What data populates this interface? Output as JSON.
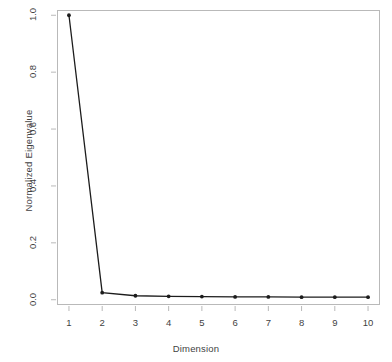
{
  "chart_data": {
    "type": "line",
    "title": "",
    "xlabel": "Dimension",
    "ylabel": "Normalized Eigenvalue",
    "x": [
      1,
      2,
      3,
      4,
      5,
      6,
      7,
      8,
      9,
      10
    ],
    "values": [
      1.0,
      0.025,
      0.014,
      0.012,
      0.011,
      0.01,
      0.01,
      0.009,
      0.009,
      0.009
    ],
    "series": [
      {
        "name": "Normalized Eigenvalue",
        "values": [
          1.0,
          0.025,
          0.014,
          0.012,
          0.011,
          0.01,
          0.01,
          0.009,
          0.009,
          0.009
        ]
      }
    ],
    "xlim": [
      0.64,
      10.36
    ],
    "ylim": [
      -0.0185,
      1.0185
    ],
    "xticks": [
      1,
      2,
      3,
      4,
      5,
      6,
      7,
      8,
      9,
      10
    ],
    "xtick_labels": [
      "1",
      "2",
      "3",
      "4",
      "5",
      "6",
      "7",
      "8",
      "9",
      "10"
    ],
    "yticks": [
      0.0,
      0.2,
      0.4,
      0.6,
      0.8,
      1.0
    ],
    "ytick_labels": [
      "0.0",
      "0.2",
      "0.4",
      "0.6",
      "0.8",
      "1.0"
    ],
    "grid": false,
    "legend": false,
    "legend_position": "none",
    "marker": "filled-circle",
    "line_color": "#1c1c1c",
    "marker_color": "#1c1c1c",
    "frame_color": "#b9b9b9",
    "background_color": "#ffffff",
    "annotations": []
  },
  "figure": {
    "x_axis_title": "Dimension",
    "y_axis_title": "Normalized Eigenvalue"
  }
}
